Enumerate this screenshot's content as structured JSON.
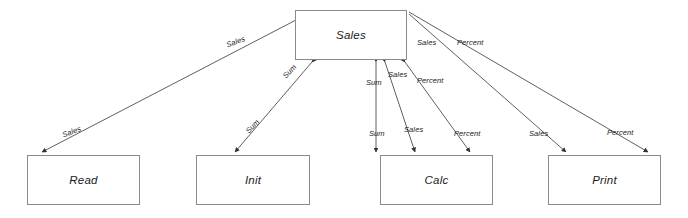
{
  "diagram": {
    "type": "data-flow-diagram",
    "canvas": {
      "width": 688,
      "height": 218,
      "background": "#ffffff"
    },
    "stroke_color": "#4d4d4d",
    "box_border_color": "#8a8a8a",
    "nodes": [
      {
        "id": "sales",
        "label": "Sales",
        "x": 295,
        "y": 10,
        "width": 112,
        "height": 50
      },
      {
        "id": "read",
        "label": "Read",
        "x": 27,
        "y": 155,
        "width": 113,
        "height": 50
      },
      {
        "id": "init",
        "label": "Init",
        "x": 196,
        "y": 155,
        "width": 114,
        "height": 50
      },
      {
        "id": "calc",
        "label": "Calc",
        "x": 380,
        "y": 155,
        "width": 113,
        "height": 50
      },
      {
        "id": "print",
        "label": "Print",
        "x": 548,
        "y": 155,
        "width": 113,
        "height": 50
      }
    ],
    "edges": [
      {
        "id": "sales-read",
        "from": "sales",
        "to": "read",
        "flow": "Sales",
        "direction": "both"
      },
      {
        "id": "sales-init",
        "from": "sales",
        "to": "init",
        "flow": "Sum",
        "direction": "both"
      },
      {
        "id": "sales-calc-sum",
        "from": "sales",
        "to": "calc",
        "flow": "Sum",
        "direction": "both"
      },
      {
        "id": "sales-calc-sales",
        "from": "calc",
        "to": "sales",
        "flow": "Sales",
        "direction": "both"
      },
      {
        "id": "sales-calc-percent",
        "from": "calc",
        "to": "sales",
        "flow": "Percent",
        "direction": "both"
      },
      {
        "id": "sales-print-sales",
        "from": "sales",
        "to": "print",
        "flow": "Sales",
        "direction": "to"
      },
      {
        "id": "sales-print-percent",
        "from": "sales",
        "to": "print",
        "flow": "Percent",
        "direction": "to"
      }
    ],
    "edge_labels": [
      {
        "id": "lbl-read-top",
        "text": "Sales",
        "x": 225,
        "y": 41,
        "rotate": -21
      },
      {
        "id": "lbl-read-bottom",
        "text": "Sales",
        "x": 61,
        "y": 131,
        "rotate": -21
      },
      {
        "id": "lbl-init-top",
        "text": "Sum",
        "x": 281,
        "y": 74,
        "rotate": -47
      },
      {
        "id": "lbl-init-bottom",
        "text": "Sum",
        "x": 244,
        "y": 129,
        "rotate": -47
      },
      {
        "id": "lbl-calc-sum-top",
        "text": "Sum",
        "x": 366,
        "y": 78,
        "rotate": 0
      },
      {
        "id": "lbl-calc-sum-bottom",
        "text": "Sum",
        "x": 369,
        "y": 129,
        "rotate": 0
      },
      {
        "id": "lbl-calc-sales-top",
        "text": "Sales",
        "x": 388,
        "y": 70,
        "rotate": 0
      },
      {
        "id": "lbl-calc-sales-bottom",
        "text": "Sales",
        "x": 404,
        "y": 125,
        "rotate": 0
      },
      {
        "id": "lbl-calc-pct-top",
        "text": "Percent",
        "x": 417,
        "y": 76,
        "rotate": 0
      },
      {
        "id": "lbl-calc-pct-bottom",
        "text": "Percent",
        "x": 454,
        "y": 129,
        "rotate": 0
      },
      {
        "id": "lbl-print-sales-top",
        "text": "Sales",
        "x": 417,
        "y": 38,
        "rotate": 0
      },
      {
        "id": "lbl-print-sales-bottom",
        "text": "Sales",
        "x": 529,
        "y": 129,
        "rotate": 0
      },
      {
        "id": "lbl-print-pct-top",
        "text": "Percent",
        "x": 457,
        "y": 38,
        "rotate": 0
      },
      {
        "id": "lbl-print-pct-bottom",
        "text": "Percent",
        "x": 607,
        "y": 128,
        "rotate": 0
      }
    ]
  }
}
